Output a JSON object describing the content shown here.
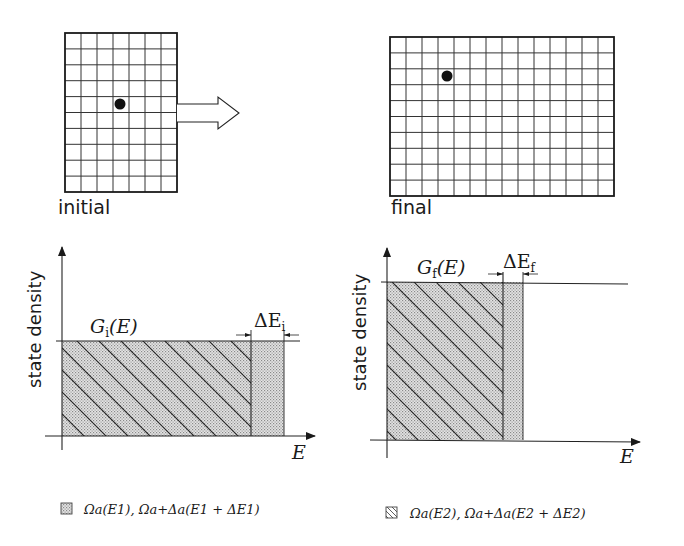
{
  "panels": {
    "initial": {
      "label": "initial",
      "grid": {
        "cols": 7,
        "rows": 10
      },
      "particle": {
        "col": 3,
        "row": 4
      }
    },
    "final": {
      "label": "final",
      "grid": {
        "cols": 14,
        "rows": 10
      },
      "particle": {
        "col": 3,
        "row": 2
      }
    },
    "transition_arrow": "hollow-right-arrow"
  },
  "charts": {
    "left": {
      "ylabel": "state density",
      "xlabel": "E",
      "region_label": "G",
      "region_sub": "i",
      "region_arg": "(E)",
      "delta_label": "ΔE",
      "delta_sub": "i"
    },
    "right": {
      "ylabel": "state density",
      "xlabel": "E",
      "region_label": "G",
      "region_sub": "f",
      "region_arg": "(E)",
      "delta_label": "ΔE",
      "delta_sub": "f"
    }
  },
  "legend": {
    "dotted": {
      "swatch": "dotted-fill",
      "text": "Ωa(E1), Ωa+Δa(E1 + ΔE1)"
    },
    "hatched": {
      "swatch": "hatched-fill",
      "text": "Ωa(E2), Ωa+Δa(E2 + ΔE2)"
    }
  },
  "chart_data": [
    {
      "type": "area",
      "title": "initial",
      "xlabel": "E",
      "ylabel": "state density",
      "regions": [
        {
          "name": "G_i(E)",
          "fill": "hatched+dotted",
          "x": [
            0,
            0.85
          ],
          "height": 0.5
        },
        {
          "name": "ΔE_i",
          "fill": "dotted",
          "x": [
            0.85,
            1.0
          ],
          "height": 0.5
        }
      ]
    },
    {
      "type": "area",
      "title": "final",
      "xlabel": "E",
      "ylabel": "state density",
      "regions": [
        {
          "name": "G_f(E)",
          "fill": "hatched+dotted",
          "x": [
            0,
            0.5
          ],
          "height": 1.0
        },
        {
          "name": "ΔE_f",
          "fill": "dotted",
          "x": [
            0.5,
            0.59
          ],
          "height": 1.0
        }
      ]
    }
  ],
  "colors": {
    "line": "#1a1a1a",
    "fill_dots": "#c8c8c8",
    "background": "#ffffff"
  }
}
